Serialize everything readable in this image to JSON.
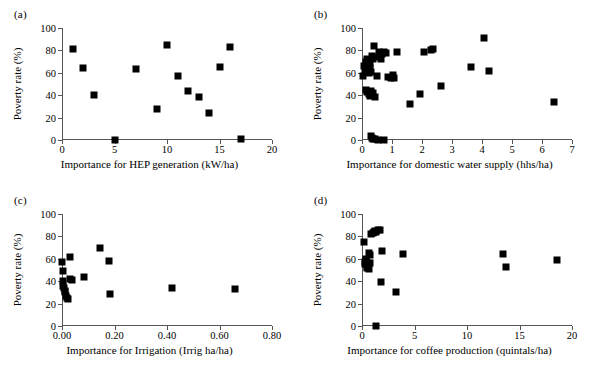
{
  "figure": {
    "ylabel": "Poverty rate (%)",
    "point_color": "#000000",
    "axis_color": "#555555"
  },
  "chart_data": [
    {
      "type": "scatter",
      "panel": "(a)",
      "title": "",
      "xlabel": "Importance for HEP generation (kW/ha)",
      "ylabel": "Poverty rate (%)",
      "xlim": [
        0,
        20
      ],
      "ylim": [
        0,
        100
      ],
      "xticks": [
        0,
        5,
        10,
        15,
        20
      ],
      "xticklabels": [
        "0",
        "5",
        "10",
        "15",
        "20"
      ],
      "yticks": [
        0,
        20,
        40,
        60,
        80,
        100
      ],
      "yticklabels": [
        "0",
        "20",
        "40",
        "60",
        "80",
        "100"
      ],
      "grid": false,
      "legend": null,
      "x": [
        1.0,
        2.0,
        3.0,
        5.0,
        7.0,
        9.0,
        10.0,
        11.0,
        12.0,
        13.0,
        14.0,
        15.0,
        16.0,
        17.0
      ],
      "y": [
        81,
        64,
        40,
        0,
        63,
        28,
        85,
        57,
        44,
        38,
        24,
        65,
        83,
        1
      ]
    },
    {
      "type": "scatter",
      "panel": "(b)",
      "title": "",
      "xlabel": "Importance for domestic water supply (hhs/ha)",
      "ylabel": "Poverty rate (%)",
      "xlim": [
        0,
        7
      ],
      "ylim": [
        0,
        100
      ],
      "xticks": [
        0,
        1,
        2,
        3,
        4,
        5,
        6,
        7
      ],
      "xticklabels": [
        "0",
        "1",
        "2",
        "3",
        "4",
        "5",
        "6",
        "7"
      ],
      "yticks": [
        0,
        20,
        40,
        60,
        80,
        100
      ],
      "yticklabels": [
        "0",
        "20",
        "40",
        "60",
        "80",
        "100"
      ],
      "grid": false,
      "legend": null,
      "x": [
        0.03,
        0.08,
        0.1,
        0.12,
        0.14,
        0.16,
        0.18,
        0.2,
        0.22,
        0.24,
        0.26,
        0.28,
        0.3,
        0.33,
        0.36,
        0.4,
        0.44,
        0.5,
        0.58,
        0.62,
        0.68,
        0.72,
        0.8,
        0.88,
        0.95,
        1.02,
        1.05,
        1.18,
        0.14,
        0.18,
        0.22,
        0.26,
        0.3,
        0.34,
        0.38,
        0.42,
        0.3,
        0.32,
        0.36,
        0.44,
        0.52,
        0.72,
        1.6,
        1.92,
        2.05,
        2.3,
        2.35,
        2.63,
        3.63,
        4.05,
        4.22,
        6.4
      ],
      "y": [
        57,
        66,
        62,
        70,
        64,
        67,
        72,
        63,
        66,
        60,
        68,
        64,
        61,
        75,
        72,
        84,
        74,
        57,
        79,
        72,
        77,
        79,
        78,
        56,
        55,
        58,
        55,
        79,
        45,
        43,
        41,
        39,
        44,
        40,
        42,
        38,
        4,
        2,
        1,
        1,
        0,
        0,
        32,
        41,
        79,
        80,
        81,
        48,
        65,
        91,
        62,
        34
      ]
    },
    {
      "type": "scatter",
      "panel": "(c)",
      "title": "",
      "xlabel": "Importance for Irrigation (Irrig ha/ha)",
      "ylabel": "Poverty rate (%)",
      "xlim": [
        0.0,
        0.8
      ],
      "ylim": [
        0,
        100
      ],
      "xticks": [
        0.0,
        0.2,
        0.4,
        0.6,
        0.8
      ],
      "xticklabels": [
        "0.00",
        "0.20",
        "0.40",
        "0.60",
        "0.80"
      ],
      "yticks": [
        0,
        20,
        40,
        60,
        80,
        100
      ],
      "yticklabels": [
        "0",
        "20",
        "40",
        "60",
        "80",
        "100"
      ],
      "grid": false,
      "legend": null,
      "x": [
        0.0,
        0.004,
        0.004,
        0.005,
        0.008,
        0.01,
        0.012,
        0.015,
        0.018,
        0.022,
        0.03,
        0.032,
        0.038,
        0.085,
        0.145,
        0.18,
        0.182,
        0.42,
        0.66
      ],
      "y": [
        57,
        49,
        40,
        36,
        34,
        31,
        30,
        27,
        25,
        24,
        62,
        42,
        41,
        44,
        70,
        58,
        29,
        34,
        33
      ]
    },
    {
      "type": "scatter",
      "panel": "(d)",
      "title": "",
      "xlabel": "Importance for coffee production (quintals/ha)",
      "ylabel": "Poverty rate (%)",
      "xlim": [
        0,
        20
      ],
      "ylim": [
        0,
        100
      ],
      "xticks": [
        0,
        5,
        10,
        15,
        20
      ],
      "xticklabels": [
        "0",
        "5",
        "10",
        "15",
        "20"
      ],
      "yticks": [
        0,
        20,
        40,
        60,
        80,
        100
      ],
      "yticklabels": [
        "0",
        "20",
        "40",
        "60",
        "80",
        "100"
      ],
      "grid": false,
      "legend": null,
      "x": [
        0.15,
        0.25,
        0.3,
        0.35,
        0.4,
        0.45,
        0.5,
        0.55,
        0.6,
        0.65,
        0.7,
        0.75,
        0.8,
        0.9,
        1.0,
        1.1,
        1.2,
        1.35,
        1.5,
        1.75,
        1.9,
        1.3,
        1.85,
        3.25,
        3.95,
        13.4,
        13.7,
        18.6
      ],
      "y": [
        75,
        57,
        55,
        60,
        58,
        52,
        54,
        56,
        53,
        51,
        65,
        63,
        56,
        82,
        83,
        84,
        85,
        84,
        86,
        86,
        67,
        0,
        39,
        30,
        64,
        64,
        53,
        59
      ]
    }
  ]
}
